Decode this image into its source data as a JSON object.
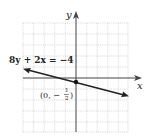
{
  "graph": {
    "equation_label": "8y + 2x = −4",
    "point_label_prefix": "(0, −",
    "point_label_num": "1",
    "point_label_den": "2",
    "point_label_suffix": ")",
    "x_axis_label": "x",
    "y_axis_label": "y",
    "point": {
      "x": 0,
      "y": -0.5
    },
    "line": {
      "slope": -0.25,
      "intercept": -0.5
    },
    "colors": {
      "grid": "#bdbdbd",
      "axis": "#333333",
      "line": "#222222"
    }
  }
}
